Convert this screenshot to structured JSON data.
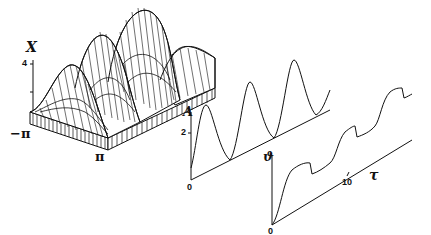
{
  "figure": {
    "surface": {
      "axis_label": "X",
      "tick_top": "4",
      "x_start_label": "−π",
      "x_end_label": "π",
      "peaks": 3
    },
    "amplitude_plot": {
      "axis_label": "A",
      "tick_mid": "2",
      "origin_label": "0"
    },
    "phase_plot": {
      "axis_label": "ϑ",
      "origin_label": "0",
      "time_tick": "10",
      "time_label": "τ"
    }
  },
  "colors": {
    "ink": "#111111",
    "background": "#ffffff"
  }
}
